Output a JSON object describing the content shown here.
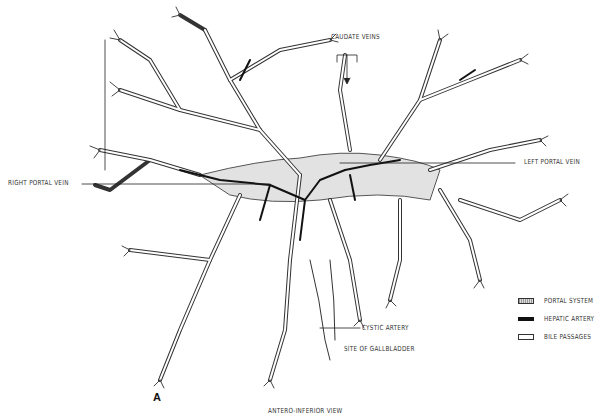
{
  "figure": {
    "panel_letter": "A",
    "view_caption": "ANTERO-INFERIOR VIEW",
    "annotations": {
      "caudate_veins": "CAUDATE VEINS",
      "left_portal_vein": "LEFT PORTAL VEIN",
      "right_portal_vein": "RIGHT PORTAL VEIN",
      "cystic_artery": "CYSTIC ARTERY",
      "site_of_gallbladder": "SITE OF GALLBLADDER"
    },
    "legend": [
      {
        "key": "portal",
        "label": "PORTAL SYSTEM",
        "style": "stippled-gray"
      },
      {
        "key": "artery",
        "label": "HEPATIC ARTERY",
        "style": "solid-black"
      },
      {
        "key": "bile",
        "label": "BILE PASSAGES",
        "style": "outline-white"
      }
    ],
    "colors": {
      "line": "#222222",
      "portal_fill": "#d0d0d0",
      "artery": "#111111",
      "background": "#ffffff"
    }
  }
}
